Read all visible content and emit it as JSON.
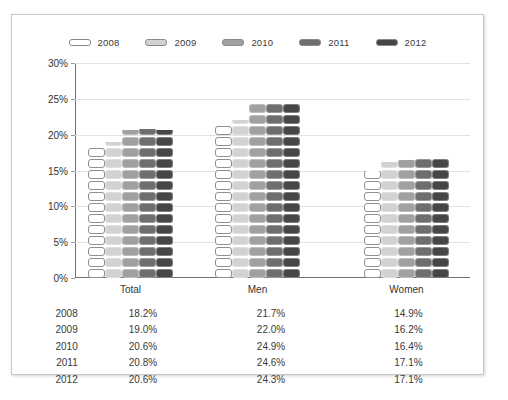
{
  "chart_data": {
    "type": "bar",
    "title": "",
    "xlabel": "",
    "ylabel": "",
    "ylim": [
      0,
      30
    ],
    "grid": true,
    "legend_position": "top-center",
    "categories": [
      "Total",
      "Men",
      "Women"
    ],
    "ytick_labels": [
      "30%",
      "25%",
      "20%",
      "15%",
      "10%",
      "5%",
      "0%"
    ],
    "ytick_values": [
      30,
      25,
      20,
      15,
      10,
      5,
      0
    ],
    "series": [
      {
        "name": "2008",
        "color": "#ffffff",
        "values": [
          18.2,
          21.7,
          14.9
        ],
        "labels": [
          "18.2%",
          "21.7%",
          "14.9%"
        ]
      },
      {
        "name": "2009",
        "color": "#d2d2d2",
        "values": [
          19.0,
          22.0,
          16.2
        ],
        "labels": [
          "19.0%",
          "22.0%",
          "16.2%"
        ]
      },
      {
        "name": "2010",
        "color": "#a0a0a0",
        "values": [
          20.6,
          24.9,
          16.4
        ],
        "labels": [
          "20.6%",
          "24.9%",
          "16.4%"
        ]
      },
      {
        "name": "2011",
        "color": "#6e6e6e",
        "values": [
          20.8,
          24.6,
          17.1
        ],
        "labels": [
          "20.8%",
          "24.6%",
          "17.1%"
        ]
      },
      {
        "name": "2012",
        "color": "#464646",
        "values": [
          20.6,
          24.3,
          17.1
        ],
        "labels": [
          "20.6%",
          "24.3%",
          "17.1%"
        ]
      }
    ]
  },
  "legend": {
    "items": [
      {
        "label": "2008",
        "color": "#ffffff"
      },
      {
        "label": "2009",
        "color": "#d2d2d2"
      },
      {
        "label": "2010",
        "color": "#a0a0a0"
      },
      {
        "label": "2011",
        "color": "#6e6e6e"
      },
      {
        "label": "2012",
        "color": "#464646"
      }
    ]
  },
  "table": {
    "header": [
      "",
      "Total",
      "Men",
      "Women"
    ],
    "rows": [
      {
        "year": "2008",
        "total": "18.2%",
        "men": "21.7%",
        "women": "14.9%"
      },
      {
        "year": "2009",
        "total": "19.0%",
        "men": "22.0%",
        "women": "16.2%"
      },
      {
        "year": "2010",
        "total": "20.6%",
        "men": "24.9%",
        "women": "16.4%"
      },
      {
        "year": "2011",
        "total": "20.8%",
        "men": "24.6%",
        "women": "17.1%"
      },
      {
        "year": "2012",
        "total": "20.6%",
        "men": "24.3%",
        "women": "17.1%"
      }
    ]
  }
}
